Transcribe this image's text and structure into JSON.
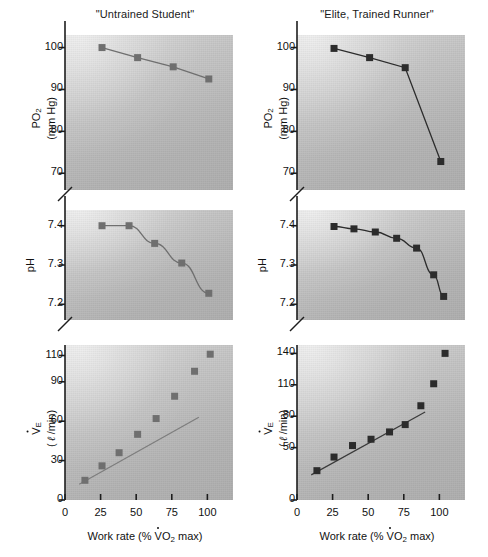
{
  "figure": {
    "columns": [
      {
        "id": "untrained",
        "title": "\"Untrained Student\""
      },
      {
        "id": "elite",
        "title": "\"Elite, Trained Runner\""
      }
    ],
    "x_axis": {
      "label_prefix": "Work rate (%",
      "label_v": "V",
      "label_o2": "O",
      "label_o2_sub": "2",
      "label_suffix": "max)",
      "ticks": [
        "0",
        "25",
        "50",
        "75",
        "100"
      ]
    },
    "rows": [
      {
        "id": "po2",
        "ylabel_line1_main": "PO",
        "ylabel_line1_sub": "2",
        "ylabel_line2": "(mm Hg)",
        "ticks": [
          "100",
          "90",
          "80",
          "70"
        ]
      },
      {
        "id": "ph",
        "ylabel_line1_main": "pH",
        "ylabel_line1_sub": "",
        "ylabel_line2": "",
        "ticks": [
          "7.4",
          "7.3",
          "7.2"
        ]
      },
      {
        "id": "ve",
        "ylabel_line1_main": "V",
        "ylabel_line1_sub": "E",
        "ylabel_line2": "( ℓ /min)",
        "ticks_left": [
          "110",
          "90",
          "60",
          "30",
          "0"
        ],
        "ticks_right": [
          "140",
          "110",
          "80",
          "50",
          "0"
        ]
      }
    ]
  },
  "chart_data": [
    {
      "id": "po2-untrained",
      "type": "line",
      "title": "\"Untrained Student\"",
      "xlabel": "Work rate (% VO2 max)",
      "ylabel": "PO2 (mm Hg)",
      "xlim": [
        0,
        118
      ],
      "ylim": [
        66,
        103
      ],
      "yticks": [
        100,
        90,
        80,
        70
      ],
      "xticks": [
        0,
        25,
        50,
        75,
        100
      ],
      "axis_break": true,
      "grid": false,
      "marker": "square",
      "series": [
        {
          "name": "PO2",
          "x": [
            26,
            51,
            76,
            101
          ],
          "y": [
            100.0,
            97.6,
            95.4,
            92.5
          ]
        }
      ]
    },
    {
      "id": "po2-elite",
      "type": "line",
      "title": "\"Elite, Trained Runner\"",
      "xlabel": "Work rate (% VO2 max)",
      "ylabel": "PO2 (mm Hg)",
      "xlim": [
        0,
        118
      ],
      "ylim": [
        66,
        103
      ],
      "yticks": [
        100,
        90,
        80,
        70
      ],
      "xticks": [
        0,
        25,
        50,
        75,
        100
      ],
      "axis_break": true,
      "grid": false,
      "marker": "square",
      "series": [
        {
          "name": "PO2",
          "x": [
            26,
            51,
            76,
            101
          ],
          "y": [
            99.8,
            97.6,
            95.2,
            72.8
          ]
        }
      ]
    },
    {
      "id": "ph-untrained",
      "type": "line",
      "title": "\"Untrained Student\"",
      "xlabel": "Work rate (% VO2 max)",
      "ylabel": "pH",
      "xlim": [
        0,
        118
      ],
      "ylim": [
        7.16,
        7.44
      ],
      "yticks": [
        7.4,
        7.3,
        7.2
      ],
      "xticks": [
        0,
        25,
        50,
        75,
        100
      ],
      "axis_break": true,
      "grid": false,
      "marker": "square",
      "series": [
        {
          "name": "pH",
          "x": [
            26,
            45,
            63,
            82,
            101
          ],
          "y": [
            7.4,
            7.4,
            7.355,
            7.305,
            7.228
          ]
        }
      ]
    },
    {
      "id": "ph-elite",
      "type": "line",
      "title": "\"Elite, Trained Runner\"",
      "xlabel": "Work rate (% VO2 max)",
      "ylabel": "pH",
      "xlim": [
        0,
        118
      ],
      "ylim": [
        7.16,
        7.44
      ],
      "yticks": [
        7.4,
        7.3,
        7.2
      ],
      "xticks": [
        0,
        25,
        50,
        75,
        100
      ],
      "axis_break": true,
      "grid": false,
      "marker": "square",
      "series": [
        {
          "name": "pH",
          "x": [
            26,
            40,
            55,
            70,
            84,
            96,
            103
          ],
          "y": [
            7.398,
            7.392,
            7.384,
            7.368,
            7.343,
            7.275,
            7.22
          ]
        }
      ]
    },
    {
      "id": "ve-untrained",
      "type": "scatter",
      "title": "\"Untrained Student\"",
      "xlabel": "Work rate (% VO2 max)",
      "ylabel": "VE ( l /min)",
      "xlim": [
        0,
        118
      ],
      "ylim": [
        0,
        118
      ],
      "yticks": [
        0,
        30,
        60,
        90,
        110
      ],
      "xticks": [
        0,
        25,
        50,
        75,
        100
      ],
      "grid": false,
      "marker": "square",
      "series": [
        {
          "name": "VE",
          "x": [
            14,
            26,
            38,
            51,
            64,
            77,
            91,
            102
          ],
          "y": [
            15,
            26,
            36,
            50,
            62,
            79,
            98,
            111
          ]
        }
      ],
      "annotations": [
        {
          "type": "trend-line",
          "x0": 10,
          "y0": 12,
          "x1": 94,
          "y1": 63
        }
      ]
    },
    {
      "id": "ve-elite",
      "type": "scatter",
      "title": "\"Elite, Trained Runner\"",
      "xlabel": "Work rate (% VO2 max)",
      "ylabel": "VE ( l /min)",
      "xlim": [
        0,
        118
      ],
      "ylim": [
        0,
        148
      ],
      "yticks": [
        0,
        50,
        80,
        110,
        140
      ],
      "xticks": [
        0,
        25,
        50,
        75,
        100
      ],
      "grid": false,
      "marker": "square",
      "series": [
        {
          "name": "VE",
          "x": [
            14,
            26,
            39,
            52,
            65,
            76,
            87,
            96,
            104
          ],
          "y": [
            28,
            41,
            52,
            58,
            65,
            72,
            90,
            111,
            140
          ]
        }
      ],
      "annotations": [
        {
          "type": "trend-line",
          "x0": 10,
          "y0": 24,
          "x1": 90,
          "y1": 84
        }
      ]
    }
  ]
}
